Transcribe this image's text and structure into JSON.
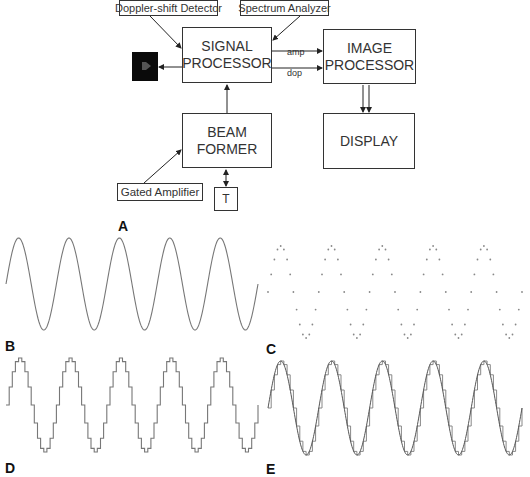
{
  "diagram": {
    "blocks": {
      "signal_processor": "SIGNAL\nPROCESSOR",
      "image_processor": "IMAGE\nPROCESSOR",
      "beam_former": "BEAM\nFORMER",
      "display": "DISPLAY",
      "transducer": "T"
    },
    "inputs": {
      "doppler_detector": "Doppler-shift Detector",
      "spectrum_analyzer": "Spectrum Analyzer",
      "gated_amplifier": "Gated Amplifier"
    },
    "signal_labels": {
      "amp": "amp",
      "dop": "dop"
    },
    "output_device": "speaker-icon"
  },
  "panels": {
    "A": "A",
    "B": "B",
    "C": "C",
    "D": "D",
    "E": "E"
  },
  "waveforms": {
    "color": "#777777",
    "cycles": 5,
    "samples_per_cycle": 16,
    "B": {
      "type": "continuous sine",
      "x0": 6,
      "x1": 258,
      "y_center": 284,
      "amplitude": 46
    },
    "C": {
      "type": "sampled dots",
      "x0": 268,
      "x1": 522,
      "y_center": 292,
      "amplitude": 46
    },
    "D": {
      "type": "staircase (sample-and-hold)",
      "x0": 6,
      "x1": 258,
      "y_center": 405,
      "amplitude": 47
    },
    "E": {
      "type": "staircase with smooth sine overlay",
      "x0": 268,
      "x1": 522,
      "y_center": 408,
      "amplitude": 47
    }
  }
}
